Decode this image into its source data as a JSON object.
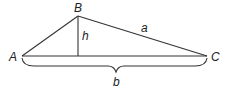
{
  "diagram": {
    "type": "triangle-with-height",
    "vertices": [
      {
        "id": "A",
        "label": "A"
      },
      {
        "id": "B",
        "label": "B"
      },
      {
        "id": "C",
        "label": "C"
      }
    ],
    "segments": {
      "side_a": {
        "label": "a",
        "from": "B",
        "to": "C"
      },
      "height": {
        "label": "h",
        "from": "B",
        "to": "foot on AC"
      },
      "base_b": {
        "label": "b",
        "from": "A",
        "to": "C",
        "marker": "brace"
      }
    },
    "colors": {
      "line": "#333333",
      "text": "#222222",
      "background": "#ffffff"
    }
  }
}
